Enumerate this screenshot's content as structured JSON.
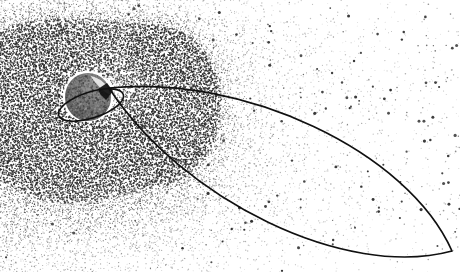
{
  "figure": {
    "alt_text": "Stippled halftone scientific illustration showing Earth as a dark sphere at left of center, surrounded by symmetric crescent-shaped radiation belt lobes rendered as dense dot stipple, with a highly elongated elliptical orbit track extending from near Earth toward the lower right corner, and sparse background particle dots filling the right half.",
    "style": "stipple-halftone",
    "background_color": "#ffffff",
    "ink_color": "#101010",
    "width": 460,
    "height": 272
  },
  "earth": {
    "label": "Earth",
    "center_x": 88,
    "center_y": 97,
    "radius_x": 23,
    "radius_y": 24,
    "fill_color": "#6e6e6e",
    "highlight_color": "#f2f2f2"
  },
  "inner_orbit": {
    "label": "Inner low-altitude orbit ring",
    "center_x": 91,
    "center_y": 105,
    "radius_x": 34,
    "radius_y": 13,
    "rotation_deg": -18,
    "stroke_width": 1.6,
    "stroke_color": "#101010"
  },
  "outer_orbit": {
    "label": "Highly elliptical transfer orbit",
    "perigee_x": 109,
    "perigee_y": 88,
    "apogee_x": 452,
    "apogee_y": 251,
    "stroke_width": 1.7,
    "stroke_color": "#101010"
  },
  "radiation_belts": [
    {
      "name": "inner-belt-left-lobe",
      "label": "Inner belt, left lobe",
      "center_x": 42,
      "center_y": 104,
      "outer_radius": 55,
      "inner_radius": 28,
      "density": "high"
    },
    {
      "name": "inner-belt-right-lobe",
      "label": "Inner belt, right lobe",
      "center_x": 150,
      "center_y": 100,
      "outer_radius": 58,
      "inner_radius": 30,
      "density": "high"
    },
    {
      "name": "outer-belt-diffuse-halo",
      "label": "Outer diffuse belt halo",
      "center_x": 96,
      "center_y": 100,
      "outer_radius": 115,
      "inner_radius": 52,
      "density": "medium"
    }
  ],
  "particle_field": {
    "label": "Background trapped particle field",
    "dense_region_x_max": 250,
    "sparse_region_x_min": 250,
    "dot_color": "#2b2b2b"
  },
  "seed": 20240617
}
